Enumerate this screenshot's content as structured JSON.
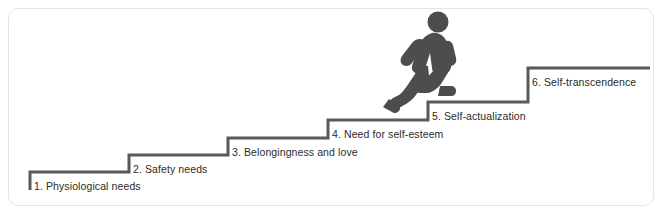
{
  "diagram": {
    "type": "staircase-diagram",
    "colors": {
      "step_line": "#595959",
      "figure": "#4d4d4d",
      "card_border": "#e3e3e3",
      "background": "#ffffff",
      "label_text": "#2b2b2b"
    },
    "figure": {
      "name": "walking-person-icon",
      "description": "silhouette of a person climbing the stairs",
      "standing_on_step": 5
    },
    "steps": [
      {
        "number": "1",
        "label": "1. Physiological needs"
      },
      {
        "number": "2",
        "label": "2. Safety needs"
      },
      {
        "number": "3",
        "label": "3. Belongingness and love"
      },
      {
        "number": "4",
        "label": "4. Need for self-esteem"
      },
      {
        "number": "5",
        "label": "5. Self-actualization"
      },
      {
        "number": "6",
        "label": "6. Self-transcendence"
      }
    ]
  }
}
